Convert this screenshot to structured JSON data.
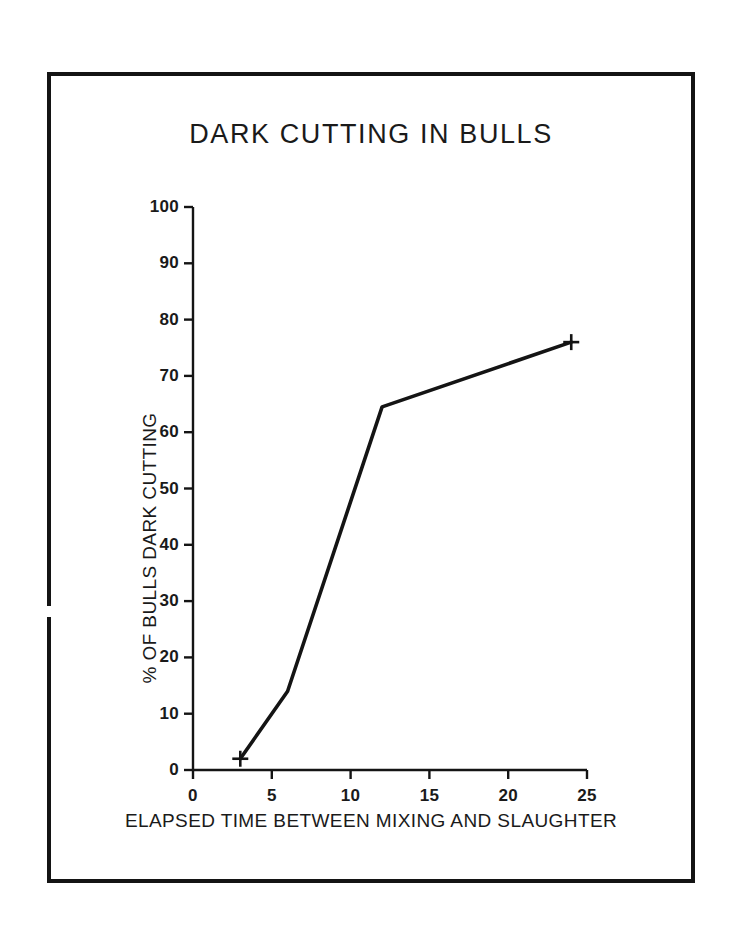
{
  "figure": {
    "title": "DARK CUTTING IN BULLS",
    "frame_color": "#141414",
    "background": "#ffffff"
  },
  "chart_data": {
    "type": "line",
    "title": "DARK CUTTING IN BULLS",
    "xlabel": "ELAPSED TIME BETWEEN MIXING AND SLAUGHTER",
    "ylabel": "% OF BULLS DARK CUTTING",
    "xlim": [
      0,
      25
    ],
    "ylim": [
      0,
      100
    ],
    "xticks": [
      0,
      5,
      10,
      15,
      20,
      25
    ],
    "yticks": [
      0,
      10,
      20,
      30,
      40,
      50,
      60,
      70,
      80,
      90,
      100
    ],
    "xtick_labels": [
      "0",
      "5",
      "10",
      "15",
      "20",
      "25"
    ],
    "ytick_labels": [
      "0",
      "10",
      "20",
      "30",
      "40",
      "50",
      "60",
      "70",
      "80",
      "90",
      "100"
    ],
    "grid": false,
    "legend": false,
    "line_color": "#141414",
    "marker": "plus",
    "series": [
      {
        "name": "% of bulls dark cutting",
        "x": [
          3,
          6,
          12,
          24
        ],
        "values": [
          2,
          14,
          64.5,
          76
        ],
        "markers_shown": [
          true,
          false,
          false,
          true
        ]
      }
    ]
  },
  "axes": {
    "y_title": "% OF BULLS DARK CUTTING",
    "x_title": "ELAPSED TIME BETWEEN MIXING AND SLAUGHTER"
  }
}
